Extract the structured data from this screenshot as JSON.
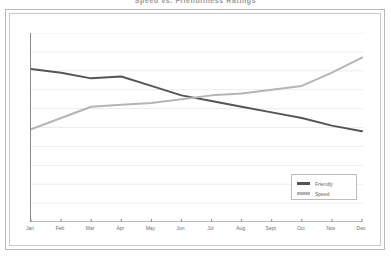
{
  "chart_data": {
    "type": "line",
    "title": "Speed vs. Friendliness Ratings",
    "xlabel": "",
    "ylabel": "",
    "categories": [
      "Jan",
      "Feb",
      "Mar",
      "Apr",
      "May",
      "Jun",
      "Jul",
      "Aug",
      "Sept",
      "Oct",
      "Nov",
      "Dec"
    ],
    "ylim": [
      0,
      100
    ],
    "grid": true,
    "gridlines": 10,
    "y_tick_labels": [],
    "legend_position": "bottom-right",
    "series": [
      {
        "name": "Friendly",
        "color": "#555555",
        "values": [
          81,
          79,
          76,
          77,
          72,
          67,
          64,
          61,
          58,
          55,
          51,
          48
        ]
      },
      {
        "name": "Speed",
        "color": "#b5b5b5",
        "values": [
          49,
          55,
          61,
          62,
          63,
          65,
          67,
          68,
          70,
          72,
          79,
          87
        ]
      }
    ]
  },
  "legend": {
    "items": [
      {
        "label": "Friendly",
        "color": "#555555"
      },
      {
        "label": "Speed",
        "color": "#b5b5b5"
      }
    ]
  },
  "colors": {
    "friendly": "#555555",
    "speed": "#b5b5b5",
    "gridline": "#ededed",
    "axis": "#8a8a8a",
    "outer_border": "#b9b9b9",
    "inner_border": "#c9c9c9",
    "legend_border": "#bdbdbd",
    "text": "#6e6e6e",
    "background": "#ffffff"
  }
}
